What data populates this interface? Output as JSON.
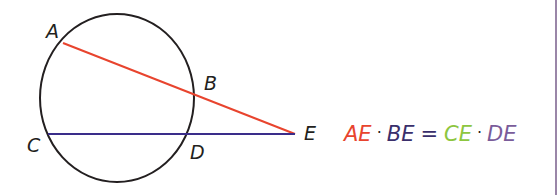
{
  "diagram": {
    "points": {
      "A": {
        "label": "A",
        "x": 63,
        "y": 43
      },
      "B": {
        "label": "B",
        "x": 198,
        "y": 96
      },
      "C": {
        "label": "C",
        "x": 48,
        "y": 134
      },
      "D": {
        "label": "D",
        "x": 191,
        "y": 134
      },
      "E": {
        "label": "E",
        "x": 295,
        "y": 134
      }
    },
    "circle": {
      "cx": 117,
      "cy": 98,
      "rx": 77,
      "ry": 84,
      "color": "#231f20"
    },
    "segments": [
      {
        "from": "A",
        "to": "E",
        "color": "#e8442e"
      },
      {
        "from": "C",
        "to": "E",
        "color": "#3a2d8a"
      }
    ]
  },
  "equation": {
    "ae": "AE",
    "dot1": "·",
    "be": "BE",
    "equals": "=",
    "ce": "CE",
    "dot2": "·",
    "de": "DE",
    "colors": {
      "ae": "#e8442e",
      "be": "#3a2f6b",
      "ce": "#8dc63f",
      "de": "#7a5c9a"
    }
  }
}
